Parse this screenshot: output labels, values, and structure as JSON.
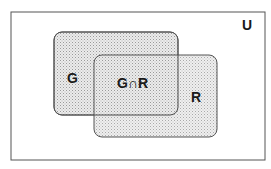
{
  "diagram": {
    "type": "venn",
    "universe": {
      "label": "U"
    },
    "sets": [
      {
        "id": "G",
        "label": "G"
      },
      {
        "id": "R",
        "label": "R"
      }
    ],
    "intersection": {
      "label": "G∩R"
    },
    "colors": {
      "border": "#555555",
      "fill": "#d9d9d9",
      "dots": "#9a9a9a",
      "text": "#1a1a1a"
    }
  }
}
